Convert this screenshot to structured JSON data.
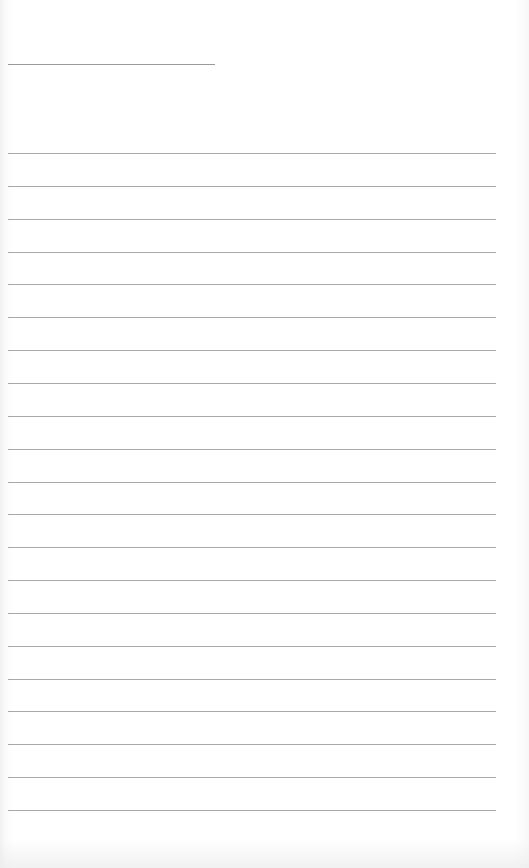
{
  "document": {
    "type": "blank lined paper",
    "header_line": {
      "present": true
    },
    "ruled_lines": {
      "count": 21
    },
    "colors": {
      "paper": "#ffffff",
      "rule": "#a8a8a8"
    }
  }
}
